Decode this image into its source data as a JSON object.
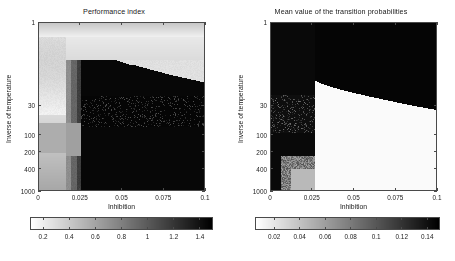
{
  "figure": {
    "background": "#ffffff",
    "axis_color": "#4a4a4a",
    "text_color": "#1a1a1a"
  },
  "chart_data": [
    {
      "type": "heatmap",
      "panel": "left",
      "title": "Performance index",
      "xlabel": "Inhibition",
      "ylabel": "Inverse of temperature",
      "xlim": [
        0,
        0.1
      ],
      "ylim": [
        1,
        1000
      ],
      "yscale": "log",
      "xticks": [
        0,
        0.025,
        0.05,
        0.075,
        0.1
      ],
      "xticklabels": [
        "0",
        "0.025",
        "0.05",
        "0.075",
        "0.1"
      ],
      "yticks": [
        1,
        30,
        100,
        200,
        400,
        1000
      ],
      "yticklabels": [
        "1",
        "30",
        "100",
        "200",
        "400",
        "1000"
      ],
      "grid": false,
      "colormap": "gray_reversed",
      "colorbar": {
        "vmin": 0.1,
        "vmax": 1.5,
        "ticks": [
          0.2,
          0.4,
          0.6,
          0.8,
          1,
          1.2,
          1.4
        ],
        "ticklabels": [
          "0.2",
          "0.4",
          "0.6",
          "0.8",
          "1",
          "1.2",
          "1.4"
        ],
        "orientation": "horizontal"
      },
      "description": "Bright (low index) plateau spans the upper-left of the map; a dark (high index) wedge occupies the lower-right and its upper boundary descends slowly from left to right. A speckled noisy band lies across the mid inverse-temperature rows.",
      "regions": [
        {
          "name": "bright-plateau-top",
          "x_range": [
            0,
            0.1
          ],
          "y_range": [
            1,
            12
          ],
          "value": 0.35
        },
        {
          "name": "bright-left-column",
          "x_range": [
            0,
            0.018
          ],
          "y_range": [
            1,
            1000
          ],
          "value": 0.3
        },
        {
          "name": "mid-gray-step",
          "x_range": [
            0.018,
            0.03
          ],
          "y_range": [
            10,
            1000
          ],
          "value": 0.85
        },
        {
          "name": "dark-wedge",
          "x_range": [
            0.03,
            0.1
          ],
          "y_range": [
            14,
            1000
          ],
          "value": 1.45
        },
        {
          "name": "speckle-band",
          "x_range": [
            0.028,
            0.1
          ],
          "y_range": [
            25,
            60
          ],
          "value": 1.3
        }
      ]
    },
    {
      "type": "heatmap",
      "panel": "right",
      "title": "Mean value of the transition probabilities",
      "xlabel": "Inhibition",
      "ylabel": "Inverse of temperature",
      "xlim": [
        0,
        0.1
      ],
      "ylim": [
        1,
        1000
      ],
      "yscale": "log",
      "xticks": [
        0,
        0.025,
        0.05,
        0.075,
        0.1
      ],
      "xticklabels": [
        "0",
        "0.025",
        "0.05",
        "0.075",
        "0.1"
      ],
      "yticks": [
        1,
        30,
        100,
        200,
        400,
        1000
      ],
      "yticklabels": [
        "1",
        "30",
        "100",
        "200",
        "400",
        "1000"
      ],
      "grid": false,
      "colormap": "gray_reversed",
      "colorbar": {
        "vmin": 0.005,
        "vmax": 0.15,
        "ticks": [
          0.02,
          0.04,
          0.06,
          0.08,
          0.1,
          0.12,
          0.14
        ],
        "ticklabels": [
          "0.02",
          "0.04",
          "0.06",
          "0.08",
          "0.1",
          "0.12",
          "0.14"
        ],
        "orientation": "horizontal"
      },
      "description": "Dark (high probability) region covers the whole top band and the left column; a sharp-edged bright (near-zero probability) block fills the lower-right quadrant starting at about inhibition 0.027, its top edge stepping gently downward toward the right.",
      "regions": [
        {
          "name": "dark-top-band",
          "x_range": [
            0,
            0.1
          ],
          "y_range": [
            1,
            20
          ],
          "value": 0.14
        },
        {
          "name": "dark-left-column",
          "x_range": [
            0,
            0.027
          ],
          "y_range": [
            1,
            1000
          ],
          "value": 0.135
        },
        {
          "name": "bright-block",
          "x_range": [
            0.027,
            0.1
          ],
          "y_range": [
            22,
            1000
          ],
          "value": 0.01
        },
        {
          "name": "speckle-left-mid",
          "x_range": [
            0,
            0.027
          ],
          "y_range": [
            25,
            70
          ],
          "value": 0.12
        },
        {
          "name": "gray-bottom-left",
          "x_range": [
            0.006,
            0.027
          ],
          "y_range": [
            300,
            1000
          ],
          "value": 0.06
        }
      ]
    }
  ]
}
